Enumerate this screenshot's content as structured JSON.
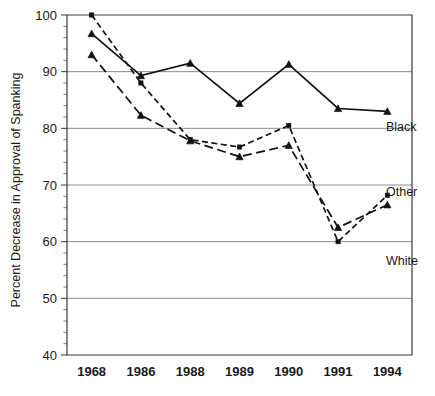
{
  "chart_data": {
    "type": "line",
    "title": "",
    "xlabel": "",
    "ylabel": "Percent Decrease in Approval of Spanking",
    "categories": [
      "1968",
      "1986",
      "1988",
      "1989",
      "1990",
      "1991",
      "1994"
    ],
    "ylim": [
      40,
      100
    ],
    "y_ticks": [
      40,
      50,
      60,
      70,
      80,
      90,
      100
    ],
    "y_tick_labels": [
      "40",
      "50",
      "60",
      "70",
      "80",
      "90",
      "100"
    ],
    "y_minor_tick_step": 2,
    "grid": true,
    "grid_axis": "y",
    "legend_position": "right-inline",
    "series": [
      {
        "name": "Black",
        "label": "Black",
        "line_style": "solid",
        "marker": "triangle",
        "color": "#111111",
        "values": [
          96.7,
          89.3,
          91.5,
          84.4,
          91.3,
          83.5,
          83.0
        ]
      },
      {
        "name": "Other",
        "label": "Other",
        "line_style": "dotted",
        "marker": "square",
        "color": "#111111",
        "values": [
          100.0,
          88.0,
          78.0,
          76.7,
          80.5,
          60.0,
          68.2
        ]
      },
      {
        "name": "White",
        "label": "White",
        "line_style": "dashed",
        "marker": "triangle",
        "color": "#111111",
        "values": [
          93.0,
          82.3,
          77.8,
          75.0,
          77.0,
          62.5,
          66.5
        ]
      }
    ]
  },
  "labels": {
    "black": "Black",
    "other": "Other",
    "white": "White"
  },
  "colors": {
    "ink": "#111111",
    "grid": "#8a8a8a",
    "frame": "#3a3a3a",
    "background": "#ffffff"
  }
}
